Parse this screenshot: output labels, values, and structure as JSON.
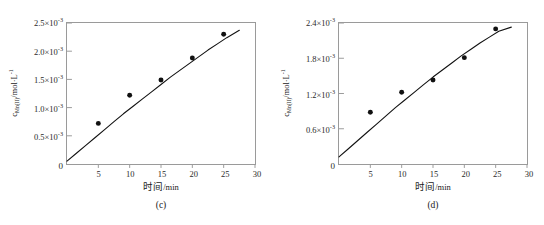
{
  "figure": {
    "background": "#ffffff",
    "frame_color": "#9a9a9a",
    "ink_color": "#111111"
  },
  "chart_data": [
    {
      "type": "scatter",
      "panel_label": "(c)",
      "title": "",
      "xlabel": "时间",
      "xunit": "/min",
      "ylabel_html": "c<sub>Mn(II)</sub>/mol·L<sup>-1</sup>",
      "ylabel": "c_Mn(II)/mol·L^-1",
      "xlim": [
        0,
        30
      ],
      "ylim": [
        0,
        0.0025
      ],
      "grid": false,
      "legend": "none",
      "xticks": [
        0,
        5,
        10,
        15,
        20,
        25,
        30
      ],
      "xticklabels": [
        "0",
        "5",
        "10",
        "15",
        "20",
        "25",
        "30"
      ],
      "yticks": [
        0,
        0.0005,
        0.001,
        0.0015,
        0.002,
        0.0025
      ],
      "yticklabels": [
        "0",
        "0.5×10<sup>-3</sup>",
        "1.0×10<sup>-3</sup>",
        "1.5×10<sup>-3</sup>",
        "2.0×10<sup>-3</sup>",
        "2.5×10<sup>-3</sup>"
      ],
      "y_exponent": "-3",
      "points": {
        "x": [
          5,
          10,
          15,
          20,
          25
        ],
        "y": [
          0.00072,
          0.00122,
          0.00149,
          0.00188,
          0.0023
        ]
      },
      "fit_curve": {
        "x": [
          0,
          1.5,
          3,
          4.5,
          6,
          7.5,
          9,
          10.5,
          12,
          13.5,
          15,
          16.5,
          18,
          19.5,
          21,
          22.5,
          24,
          25.5,
          27.5
        ],
        "y": [
          5e-05,
          0.00019,
          0.00033,
          0.00047,
          0.00061,
          0.00075,
          0.00089,
          0.00102,
          0.00115,
          0.00128,
          0.00141,
          0.00154,
          0.00166,
          0.00178,
          0.0019,
          0.00202,
          0.00213,
          0.00224,
          0.00237
        ]
      }
    },
    {
      "type": "scatter",
      "panel_label": "(d)",
      "title": "",
      "xlabel": "时间",
      "xunit": "/min",
      "ylabel_html": "c<sub>Mn(II)</sub>/mol·L<sup>-1</sup>",
      "ylabel": "c_Mn(II)/mol·L^-1",
      "xlim": [
        0,
        30
      ],
      "ylim": [
        0,
        0.0024
      ],
      "grid": false,
      "legend": "none",
      "xticks": [
        0,
        5,
        10,
        15,
        20,
        25,
        30
      ],
      "xticklabels": [
        "0",
        "5",
        "10",
        "15",
        "20",
        "25",
        "30"
      ],
      "yticks": [
        0,
        0.0006,
        0.0012,
        0.0018,
        0.0024
      ],
      "yticklabels": [
        "0",
        "0.6×10<sup>-3</sup>",
        "1.2×10<sup>-3</sup>",
        "1.8×10<sup>-3</sup>",
        "2.4×10<sup>-3</sup>"
      ],
      "y_exponent": "-3",
      "points": {
        "x": [
          5,
          10,
          15,
          20,
          25
        ],
        "y": [
          0.00088,
          0.00122,
          0.00143,
          0.00181,
          0.0023
        ]
      },
      "fit_curve": {
        "x": [
          0,
          1.5,
          3,
          4.5,
          6,
          7.5,
          9,
          10.5,
          12,
          13.5,
          15,
          16.5,
          18,
          19.5,
          21,
          22.5,
          24,
          25.5,
          27.5
        ],
        "y": [
          0.00012,
          0.00026,
          0.0004,
          0.00054,
          0.00068,
          0.00082,
          0.00096,
          0.00109,
          0.00122,
          0.00135,
          0.00148,
          0.0016,
          0.00172,
          0.00184,
          0.00195,
          0.00206,
          0.00216,
          0.00226,
          0.00233
        ]
      }
    }
  ]
}
